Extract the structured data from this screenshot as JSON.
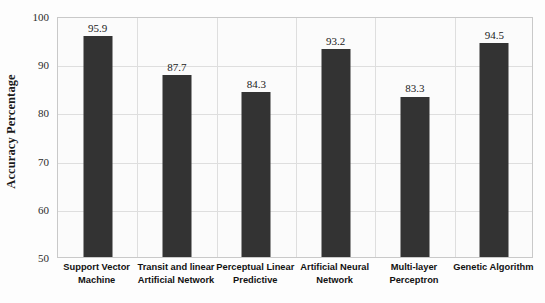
{
  "chart_data": {
    "type": "bar",
    "title": "",
    "xlabel": "",
    "ylabel": "Accuracy Percentage",
    "ylim": [
      50,
      100
    ],
    "yticks": [
      50,
      60,
      70,
      80,
      90,
      100
    ],
    "ytick_labels": [
      "50",
      "60",
      "70",
      "80",
      "90",
      "100"
    ],
    "grid": true,
    "legend": "none",
    "categories": [
      "Support Vector Machine",
      "Transit and linear Artificial Network",
      "Perceptual Linear Predictive",
      "Artificial Neural Network",
      "Multi-layer Perceptron",
      "Genetic Algorithm"
    ],
    "category_lines": [
      [
        "Support Vector",
        "Machine"
      ],
      [
        "Transit and linear",
        "Artificial Network"
      ],
      [
        "Perceptual Linear",
        "Predictive"
      ],
      [
        "Artificial Neural",
        "Network"
      ],
      [
        "Multi-layer",
        "Perceptron"
      ],
      [
        "Genetic Algorithm"
      ]
    ],
    "values": [
      95.9,
      87.7,
      84.3,
      93.2,
      83.3,
      94.5
    ],
    "value_labels": [
      "95.9",
      "87.7",
      "84.3",
      "93.2",
      "83.3",
      "94.5"
    ],
    "bar_color": "#333333",
    "plot_background": "#fbfbfb",
    "gridline_color": "#dedede",
    "axis_border_color": "#c9c9c9"
  }
}
